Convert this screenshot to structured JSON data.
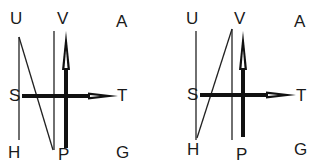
{
  "figure": {
    "panels": [
      {
        "id": "left",
        "labels": {
          "U": "U",
          "V": "V",
          "A": "A",
          "S": "S",
          "T": "T",
          "H": "H",
          "P": "P",
          "G": "G"
        }
      },
      {
        "id": "right",
        "labels": {
          "U": "U",
          "V": "V",
          "A": "A",
          "S": "S",
          "T": "T",
          "H": "H",
          "P": "P",
          "G": "G"
        }
      }
    ],
    "colors": {
      "ink": "#111111",
      "background": "#ffffff"
    }
  }
}
